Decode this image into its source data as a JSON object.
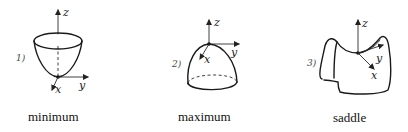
{
  "figures": [
    {
      "id": "minimum",
      "number_label": "1)",
      "caption": "minimum",
      "axes": {
        "z": "z",
        "y": "y",
        "x": "x"
      },
      "surface": "paraboloid-bowl"
    },
    {
      "id": "maximum",
      "number_label": "2)",
      "caption": "maximum",
      "axes": {
        "z": "z",
        "y": "y",
        "x": "x"
      },
      "surface": "dome"
    },
    {
      "id": "saddle",
      "number_label": "3)",
      "caption": "saddle",
      "axes": {
        "z": "z",
        "y": "y",
        "x": "x"
      },
      "surface": "saddle"
    }
  ],
  "colors": {
    "ink": "#1a1a1a",
    "background": "#ffffff"
  }
}
